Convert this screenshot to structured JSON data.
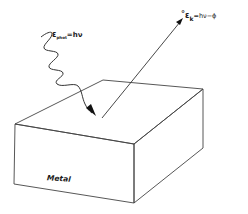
{
  "figure": {
    "photon_label": {
      "symbol": "ε",
      "subscript": "phot",
      "equation": "=hν"
    },
    "electron_label": {
      "marker": "°",
      "symbol": "ε",
      "subscript": "k",
      "equation": "=hν−ϕ"
    },
    "material_label": "Metal",
    "colors": {
      "line": "#333333",
      "text": "#1a1a1a",
      "background": "#ffffff"
    }
  }
}
